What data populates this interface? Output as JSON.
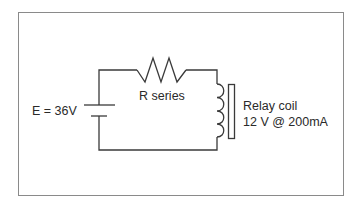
{
  "diagram": {
    "type": "circuit-schematic",
    "colors": {
      "wire": "#3a3a3a",
      "frame": "#8a8a8a",
      "text": "#2a2a2a",
      "background": "#ffffff"
    },
    "components": {
      "source": {
        "label": "E = 36V",
        "symbol": "battery"
      },
      "resistor": {
        "label": "R series",
        "symbol": "resistor-zigzag"
      },
      "relay": {
        "label_line1": "Relay coil",
        "label_line2": "12 V @ 200mA",
        "symbol": "inductor-with-core"
      }
    }
  }
}
